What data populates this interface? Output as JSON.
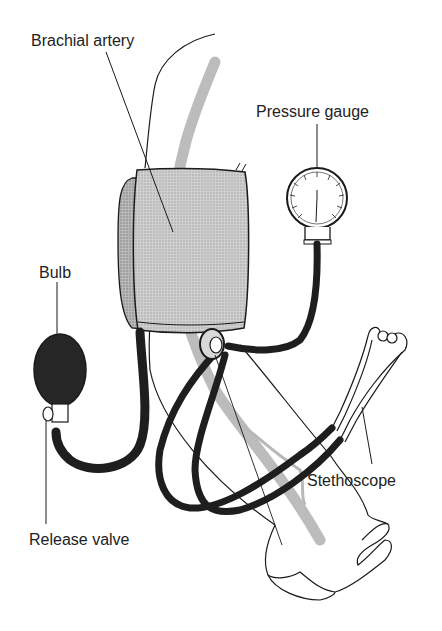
{
  "diagram": {
    "type": "labeled-illustration",
    "labels": {
      "brachial_artery": "Brachial artery",
      "pressure_gauge": "Pressure gauge",
      "bulb": "Bulb",
      "stethoscope": "Stethoscope",
      "release_valve": "Release valve"
    },
    "colors": {
      "ink": "#1a1a1a",
      "cuff_fill": "#a9a9a9",
      "cuff_shadow": "#8a8a8a",
      "artery": "#b5b5b5",
      "tubing": "#1e1e1e",
      "bulb": "#262626",
      "background": "#ffffff"
    }
  }
}
